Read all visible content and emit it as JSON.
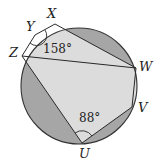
{
  "diagram": {
    "type": "inscribed-polygon-in-circle",
    "colors": {
      "background": "#ffffff",
      "circle_stroke": "#333333",
      "segment_dark": "#a6a6a6",
      "polygon_light": "#dcdcdc",
      "line": "#2a2a2a"
    },
    "vertices": [
      {
        "name": "X",
        "label": "X"
      },
      {
        "name": "Y",
        "label": "Y"
      },
      {
        "name": "Z",
        "label": "Z"
      },
      {
        "name": "W",
        "label": "W"
      },
      {
        "name": "V",
        "label": "V"
      },
      {
        "name": "U",
        "label": "U"
      }
    ],
    "angles": [
      {
        "vertex": "Y",
        "label": "158°"
      },
      {
        "vertex": "U",
        "label": "88°"
      }
    ]
  }
}
